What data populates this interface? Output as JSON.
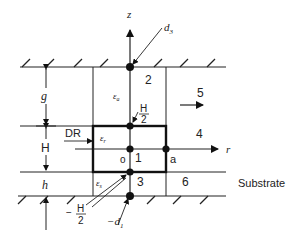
{
  "diagram": {
    "axes": {
      "vertical": "z",
      "horizontal": "r"
    },
    "dimensions": {
      "top_gap": "g",
      "resonator_height": "H",
      "substrate_height": "h"
    },
    "permittivities": {
      "air": "εa",
      "resonator": "εr",
      "substrate": "εs"
    },
    "regions": [
      "1",
      "2",
      "3",
      "4",
      "5",
      "6"
    ],
    "labels": {
      "resonator": "DR",
      "origin": "o",
      "radius": "a",
      "substrate": "Substrate",
      "top_point": "d3",
      "bottom_point": "−d1",
      "half_height_top_num": "H",
      "half_height_top_den": "2",
      "half_height_bottom_sign": "−",
      "half_height_bottom_num": "H",
      "half_height_bottom_den": "2"
    }
  }
}
